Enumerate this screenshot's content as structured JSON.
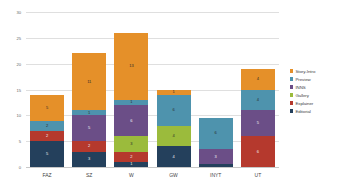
{
  "chart_data": {
    "type": "bar",
    "subtype": "stacked-bar",
    "title": "",
    "xlabel": "",
    "ylabel": "",
    "ylim": [
      0,
      30
    ],
    "ytick_labels": [
      "0",
      "5",
      "10",
      "15",
      "20",
      "25",
      "30"
    ],
    "ytick_values": [
      0,
      5,
      10,
      15,
      20,
      25,
      30
    ],
    "grid": true,
    "legend_position": "right",
    "categories": [
      "FAZ",
      "SZ",
      "W",
      "GW",
      "INYT",
      "UT"
    ],
    "series": [
      {
        "name": "Editorial",
        "color": "#24405C",
        "values": [
          5,
          3,
          1,
          4,
          0.5,
          0
        ]
      },
      {
        "name": "Explainer",
        "color": "#B5392D",
        "values": [
          2,
          2,
          2,
          0,
          0,
          6
        ]
      },
      {
        "name": "Gallery",
        "color": "#9BBB3C",
        "values": [
          0,
          0,
          3,
          4,
          0,
          0
        ]
      },
      {
        "name": "INNS",
        "color": "#6B4E87",
        "values": [
          0,
          5,
          6,
          0,
          3,
          5
        ]
      },
      {
        "name": "Preview",
        "color": "#4E93AD",
        "values": [
          2,
          1,
          1,
          6,
          6,
          4
        ]
      },
      {
        "name": "Story-Intro",
        "color": "#E59029",
        "values": [
          5,
          11,
          13,
          1,
          0,
          4
        ]
      }
    ],
    "totals": [
      14,
      22,
      26,
      15,
      9.5,
      19
    ],
    "bar_labels": {
      "FAZ": [
        "5",
        "2",
        "",
        "",
        "2",
        "5"
      ],
      "SZ": [
        "3",
        "2",
        "",
        "5",
        "1",
        "11"
      ],
      "W": [
        "1",
        "2",
        "3",
        "6",
        "1",
        "13"
      ],
      "GW": [
        "4",
        "",
        "4",
        "",
        "6",
        "1"
      ],
      "INYT": [
        "",
        "",
        "",
        "3",
        "6",
        ""
      ],
      "UT": [
        "",
        "6",
        "",
        "5",
        "4",
        "4"
      ]
    }
  },
  "legend": {
    "items": [
      {
        "label": "Story-Intro",
        "color": "#E59029"
      },
      {
        "label": "Preview",
        "color": "#4E93AD"
      },
      {
        "label": "INNS",
        "color": "#6B4E87"
      },
      {
        "label": "Gallery",
        "color": "#9BBB3C"
      },
      {
        "label": "Explainer",
        "color": "#B5392D"
      },
      {
        "label": "Editorial",
        "color": "#24405C"
      }
    ]
  }
}
